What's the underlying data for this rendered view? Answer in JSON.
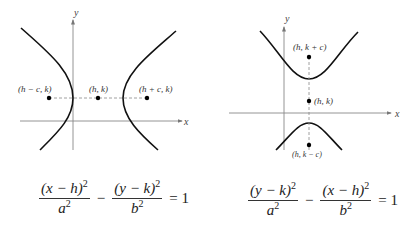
{
  "left_graph": {
    "x_axis_label": "x",
    "y_axis_label": "y",
    "points": [
      {
        "label": "(h − c, k)",
        "role": "focus-left"
      },
      {
        "label": "(h, k)",
        "role": "center"
      },
      {
        "label": "(h + c, k)",
        "role": "focus-right"
      }
    ],
    "orientation": "horizontal transverse axis",
    "equation": {
      "term1_num": "(x − h)",
      "term1_den": "a",
      "minus": "−",
      "term2_num": "(y − k)",
      "term2_den": "b",
      "exp": "2",
      "rhs": "= 1"
    }
  },
  "right_graph": {
    "x_axis_label": "x",
    "y_axis_label": "y",
    "points": [
      {
        "label": "(h, k + c)",
        "role": "focus-top"
      },
      {
        "label": "(h, k)",
        "role": "center"
      },
      {
        "label": "(h, k − c)",
        "role": "focus-bottom"
      }
    ],
    "orientation": "vertical transverse axis",
    "equation": {
      "term1_num": "(y − k)",
      "term1_den": "a",
      "minus": "−",
      "term2_num": "(x − h)",
      "term2_den": "b",
      "exp": "2",
      "rhs": "= 1"
    }
  },
  "colors": {
    "curve": "#111111",
    "axis": "#777777",
    "dashed": "#888888",
    "point": "#000000"
  }
}
